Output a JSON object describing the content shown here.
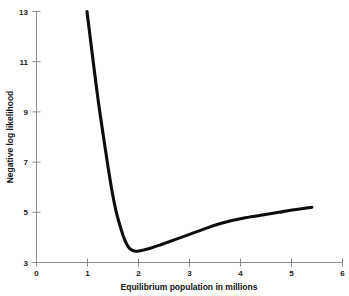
{
  "chart_data": {
    "type": "line",
    "title": "",
    "xlabel": "Equilibrium population in millions",
    "ylabel": "Negative log likelihood",
    "xlim": [
      0,
      6
    ],
    "ylim": [
      3,
      13
    ],
    "xticks": [
      "0",
      "1",
      "2",
      "3",
      "4",
      "5",
      "6"
    ],
    "yticks": [
      "3",
      "5",
      "7",
      "9",
      "11",
      "13"
    ],
    "xtick_values": [
      0,
      1,
      2,
      3,
      4,
      5,
      6
    ],
    "ytick_values": [
      3,
      5,
      7,
      9,
      11,
      13
    ],
    "grid": false,
    "legend": false,
    "series": [
      {
        "name": "Negative log likelihood profile",
        "color": "#0d0d0d",
        "x": [
          0.99,
          1.06,
          1.14,
          1.22,
          1.31,
          1.4,
          1.48,
          1.56,
          1.64,
          1.72,
          1.8,
          1.88,
          1.97,
          2.1,
          2.25,
          2.45,
          2.7,
          3.0,
          3.35,
          3.7,
          4.05,
          4.4,
          4.75,
          5.05,
          5.4
        ],
        "y": [
          13.0,
          11.85,
          10.55,
          9.3,
          8.05,
          6.85,
          5.85,
          5.05,
          4.45,
          3.95,
          3.62,
          3.48,
          3.45,
          3.5,
          3.58,
          3.72,
          3.9,
          4.12,
          4.38,
          4.6,
          4.76,
          4.88,
          5.0,
          5.1,
          5.2
        ]
      }
    ]
  },
  "axis_labels": {
    "x_title": "Equilibrium population in millions",
    "y_title": "Negative log likelihood"
  },
  "ticks": {
    "x": [
      "0",
      "1",
      "2",
      "3",
      "4",
      "5",
      "6"
    ],
    "y": [
      "3",
      "5",
      "7",
      "9",
      "11",
      "13"
    ]
  }
}
